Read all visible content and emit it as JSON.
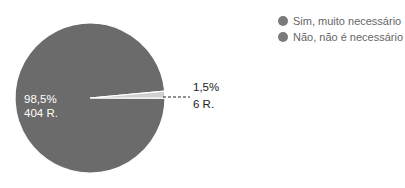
{
  "chart_data": {
    "type": "pie",
    "title": "",
    "categories": [
      "Sim, muito necessário",
      "Não, não é necessário"
    ],
    "values": [
      404,
      6
    ],
    "percentages": [
      "98,5%",
      "1,5%"
    ],
    "value_labels": [
      "404 R.",
      "6 R."
    ],
    "colors": [
      "#6b6b6b",
      "#d0d0d0"
    ],
    "legend_position": "right"
  },
  "legend": {
    "items": [
      {
        "label": "Sim, muito necessário",
        "color": "#7a7a7a"
      },
      {
        "label": "Não, não é necessário",
        "color": "#7a7a7a"
      }
    ]
  },
  "labels": {
    "major_pct": "98,5%",
    "major_count": "404 R.",
    "minor_pct": "1,5%",
    "minor_count": "6 R."
  }
}
